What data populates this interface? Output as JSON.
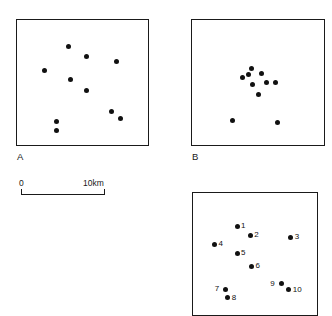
{
  "figure": {
    "background_color": "#ffffff",
    "dot_color": "#111111",
    "frame_color": "#1a1a1a"
  },
  "panels": [
    {
      "id": "A",
      "label": "A",
      "frame": {
        "x": 16,
        "y": 19,
        "width": 133,
        "height": 127
      },
      "pattern": "random / dispersed",
      "point_count": 10,
      "points": [
        {
          "x": 0.385,
          "y": 0.205
        },
        {
          "x": 0.525,
          "y": 0.29
        },
        {
          "x": 0.205,
          "y": 0.395
        },
        {
          "x": 0.405,
          "y": 0.465
        },
        {
          "x": 0.745,
          "y": 0.33
        },
        {
          "x": 0.52,
          "y": 0.555
        },
        {
          "x": 0.71,
          "y": 0.72
        },
        {
          "x": 0.775,
          "y": 0.775
        },
        {
          "x": 0.3,
          "y": 0.8
        },
        {
          "x": 0.295,
          "y": 0.87
        }
      ]
    },
    {
      "id": "B",
      "label": "B",
      "frame": {
        "x": 191,
        "y": 19,
        "width": 134,
        "height": 127
      },
      "pattern": "clustered",
      "point_count": 10,
      "points": [
        {
          "x": 0.445,
          "y": 0.385
        },
        {
          "x": 0.52,
          "y": 0.42
        },
        {
          "x": 0.375,
          "y": 0.455
        },
        {
          "x": 0.42,
          "y": 0.43
        },
        {
          "x": 0.555,
          "y": 0.49
        },
        {
          "x": 0.625,
          "y": 0.495
        },
        {
          "x": 0.455,
          "y": 0.51
        },
        {
          "x": 0.495,
          "y": 0.59
        },
        {
          "x": 0.3,
          "y": 0.79
        },
        {
          "x": 0.64,
          "y": 0.805
        }
      ]
    },
    {
      "id": "C",
      "label": "",
      "frame": {
        "x": 192,
        "y": 192,
        "width": 126,
        "height": 124
      },
      "pattern": "numbered points",
      "point_count": 10,
      "points": [
        {
          "number": "1",
          "x": 0.35,
          "y": 0.27,
          "label_side": "right"
        },
        {
          "number": "2",
          "x": 0.455,
          "y": 0.34,
          "label_side": "right"
        },
        {
          "number": "3",
          "x": 0.775,
          "y": 0.355,
          "label_side": "right"
        },
        {
          "number": "4",
          "x": 0.17,
          "y": 0.415,
          "label_side": "right"
        },
        {
          "number": "5",
          "x": 0.35,
          "y": 0.485,
          "label_side": "right"
        },
        {
          "number": "6",
          "x": 0.465,
          "y": 0.59,
          "label_side": "right"
        },
        {
          "number": "7",
          "x": 0.26,
          "y": 0.775,
          "label_side": "left"
        },
        {
          "number": "8",
          "x": 0.275,
          "y": 0.845,
          "label_side": "right"
        },
        {
          "number": "9",
          "x": 0.7,
          "y": 0.73,
          "label_side": "left"
        },
        {
          "number": "10",
          "x": 0.76,
          "y": 0.78,
          "label_side": "right"
        }
      ]
    }
  ],
  "scalebar": {
    "name": "distance-scale-bar",
    "zero_label": "0",
    "max_label": "10km",
    "length_km": 10
  }
}
